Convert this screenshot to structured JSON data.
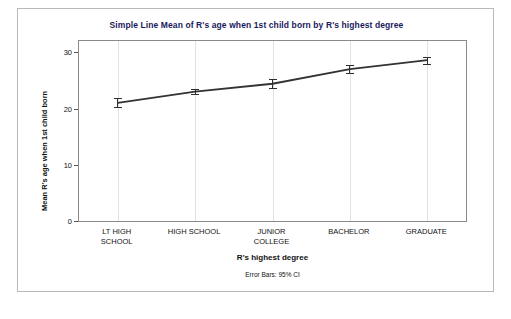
{
  "chart_data": {
    "type": "line",
    "title": "Simple Line Mean of R's age when 1st child born by R's highest degree",
    "xlabel": "R's highest degree",
    "ylabel": "Mean R's age when 1st child born",
    "footnote": "Error Bars: 95% CI",
    "categories": [
      "LT HIGH\nSCHOOL",
      "HIGH SCHOOL",
      "JUNIOR\nCOLLEGE",
      "BACHELOR",
      "GRADUATE"
    ],
    "values": [
      21.0,
      23.0,
      24.4,
      27.0,
      28.6
    ],
    "error_low": [
      20.2,
      22.5,
      23.6,
      26.3,
      27.9
    ],
    "error_high": [
      21.9,
      23.5,
      25.3,
      27.7,
      29.2
    ],
    "ylim": [
      0,
      32
    ],
    "yticks": [
      0,
      10,
      20,
      30
    ],
    "ytick_labels": [
      "0",
      "10",
      "20",
      "30"
    ],
    "grid": "vertical",
    "legend": "none",
    "line_color": "#333333",
    "marker": "none"
  }
}
